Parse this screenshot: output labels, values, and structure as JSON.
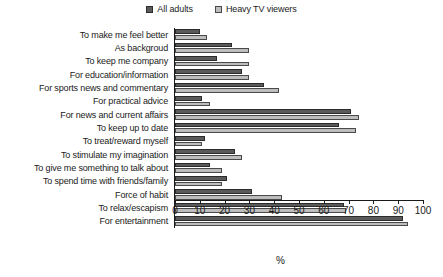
{
  "chart_data": {
    "type": "bar",
    "orientation": "horizontal",
    "title": "",
    "xlabel": "%",
    "ylabel": "",
    "xlim": [
      0,
      100
    ],
    "xticks": [
      0,
      10,
      20,
      30,
      40,
      50,
      60,
      70,
      80,
      90,
      100
    ],
    "grid": false,
    "legend_position": "top-center",
    "categories": [
      "To make me feel better",
      "As backgroud",
      "To keep me company",
      "For education/information",
      "For sports news and commentary",
      "For practical advice",
      "For news and current affairs",
      "To keep up to date",
      "To treat/reward myself",
      "To stimulate my imagination",
      "To give me something to talk about",
      "To spend time with friends/family",
      "Force of habit",
      "To relax/escapism",
      "For entertainment"
    ],
    "series": [
      {
        "name": "All adults",
        "color": "#5a5a5a",
        "values": [
          10,
          23,
          17,
          27,
          36,
          11,
          71,
          66,
          12,
          24,
          14,
          21,
          31,
          68,
          92
        ]
      },
      {
        "name": "Heavy TV viewers",
        "color": "#bdbdbd",
        "values": [
          13,
          30,
          30,
          30,
          42,
          14,
          74,
          73,
          11,
          27,
          19,
          19,
          43,
          69,
          94
        ]
      }
    ]
  },
  "legend": {
    "entries": [
      {
        "label": "All adults",
        "swatch": "legend-swatch-dark"
      },
      {
        "label": "Heavy TV viewers",
        "swatch": "legend-swatch-light"
      }
    ]
  }
}
